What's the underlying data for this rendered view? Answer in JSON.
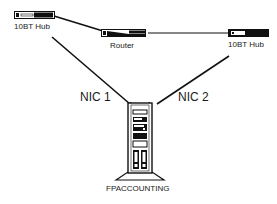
{
  "diagram": {
    "title": "",
    "nodes": [
      {
        "id": "hub1",
        "label": "10BT Hub",
        "type": "hub"
      },
      {
        "id": "router",
        "label": "Router",
        "type": "router"
      },
      {
        "id": "hub2",
        "label": "10BT Hub",
        "type": "hub"
      },
      {
        "id": "server",
        "label": "FPACCOUNTING",
        "type": "server-tower"
      }
    ],
    "edges": [
      {
        "from": "hub1",
        "to": "router",
        "label": ""
      },
      {
        "from": "router",
        "to": "hub2",
        "label": ""
      },
      {
        "from": "hub1",
        "to": "server",
        "label": "NIC 1"
      },
      {
        "from": "hub2",
        "to": "server",
        "label": "NIC 2"
      }
    ],
    "colors": {
      "line": "#111111",
      "device": "#111111",
      "background": "#ffffff"
    }
  }
}
